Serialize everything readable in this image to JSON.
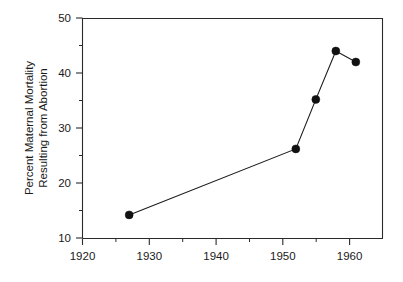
{
  "chart_data": {
    "type": "line",
    "title": "",
    "subtitle": "",
    "xlabel": "",
    "ylabel": "Percent Maternal Mortality Resulting from Abortion",
    "ylabel_line1": "Percent Maternal Mortality",
    "ylabel_line2": "Resulting from Abortion",
    "xlim": [
      1920,
      1965
    ],
    "ylim": [
      10,
      50
    ],
    "xticks": [
      1920,
      1930,
      1940,
      1950,
      1960
    ],
    "xticklabels": [
      "1920",
      "1930",
      "1940",
      "1950",
      "1960"
    ],
    "xminorticks": [
      1925,
      1935,
      1945,
      1955,
      1965
    ],
    "yticks": [
      10,
      20,
      30,
      40,
      50
    ],
    "yticklabels": [
      "10",
      "20",
      "30",
      "40",
      "50"
    ],
    "yminorticks": [
      15,
      25,
      35,
      45
    ],
    "grid": false,
    "legend": false,
    "legend_position": "none",
    "marker": "filled-circle",
    "line_color": "#1a1a1a",
    "marker_color": "#111111",
    "x": [
      1927,
      1952,
      1955,
      1958,
      1961
    ],
    "values": [
      14.2,
      26.2,
      35.2,
      44.0,
      42.0
    ],
    "series": [
      {
        "name": "Percent Maternal Mortality Resulting from Abortion",
        "x": [
          1927,
          1952,
          1955,
          1958,
          1961
        ],
        "values": [
          14.2,
          26.2,
          35.2,
          44.0,
          42.0
        ]
      }
    ],
    "annotations": []
  },
  "axes": {
    "y_tick_0": "10",
    "y_tick_1": "20",
    "y_tick_2": "30",
    "y_tick_3": "40",
    "y_tick_4": "50",
    "x_tick_0": "1920",
    "x_tick_1": "1930",
    "x_tick_2": "1940",
    "x_tick_3": "1950",
    "x_tick_4": "1960"
  }
}
